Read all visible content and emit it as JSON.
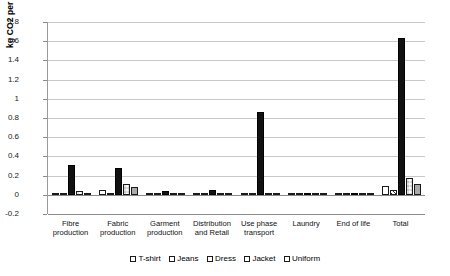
{
  "chart_data": {
    "type": "bar",
    "title": "",
    "xlabel": "",
    "ylabel": "kg CO2 per use",
    "ylim": [
      -0.2,
      1.8
    ],
    "ytick_step": 0.2,
    "yticks": [
      "1.8",
      "1.6",
      "1.4",
      "1.2",
      "1",
      "0.8",
      "0.6",
      "0.4",
      "0.2",
      "0",
      "-0.2"
    ],
    "grid": true,
    "legend_position": "bottom",
    "categories": [
      "Fibre production",
      "Fabric production",
      "Garment production",
      "Distribution and Retail",
      "Use phase transport",
      "Laundry",
      "End of life",
      "Total"
    ],
    "category_lines": [
      [
        "Fibre",
        "production"
      ],
      [
        "Fabric",
        "production"
      ],
      [
        "Garment",
        "production"
      ],
      [
        "Distribution",
        "and Retail"
      ],
      [
        "Use phase",
        "transport"
      ],
      [
        "Laundry"
      ],
      [
        "End of life"
      ],
      [
        "Total"
      ]
    ],
    "series": [
      {
        "name": "T-shirt",
        "pattern": "white",
        "values": [
          0.005,
          0.055,
          0.004,
          0.004,
          0.004,
          0.012,
          0.003,
          0.09
        ]
      },
      {
        "name": "Jeans",
        "pattern": "diagonal-hatch",
        "values": [
          0.006,
          0.012,
          0.006,
          0.004,
          0.006,
          0.01,
          0.003,
          0.05
        ]
      },
      {
        "name": "Dress",
        "pattern": "black",
        "values": [
          0.31,
          0.28,
          0.04,
          0.05,
          0.86,
          0.012,
          0.012,
          1.63
        ]
      },
      {
        "name": "Jacket",
        "pattern": "checkered",
        "values": [
          0.035,
          0.11,
          0.008,
          0.005,
          0.008,
          0.005,
          0.004,
          0.175
        ]
      },
      {
        "name": "Uniform",
        "pattern": "gray",
        "values": [
          0.006,
          0.085,
          0.006,
          0.004,
          0.006,
          0.008,
          0.003,
          0.115
        ]
      }
    ],
    "colors": {
      "tshirt": "#ffffff",
      "jeans": "#ffffff",
      "dress": "#111111",
      "jacket": "#ffffff",
      "uniform": "#a9a9a9",
      "gridline": "#c8c8c8",
      "axis": "#8a8a8a",
      "text": "#111111"
    }
  },
  "legend": {
    "items": [
      {
        "label": "T-shirt"
      },
      {
        "label": "Jeans"
      },
      {
        "label": "Dress"
      },
      {
        "label": "Jacket"
      },
      {
        "label": "Uniform"
      }
    ]
  }
}
